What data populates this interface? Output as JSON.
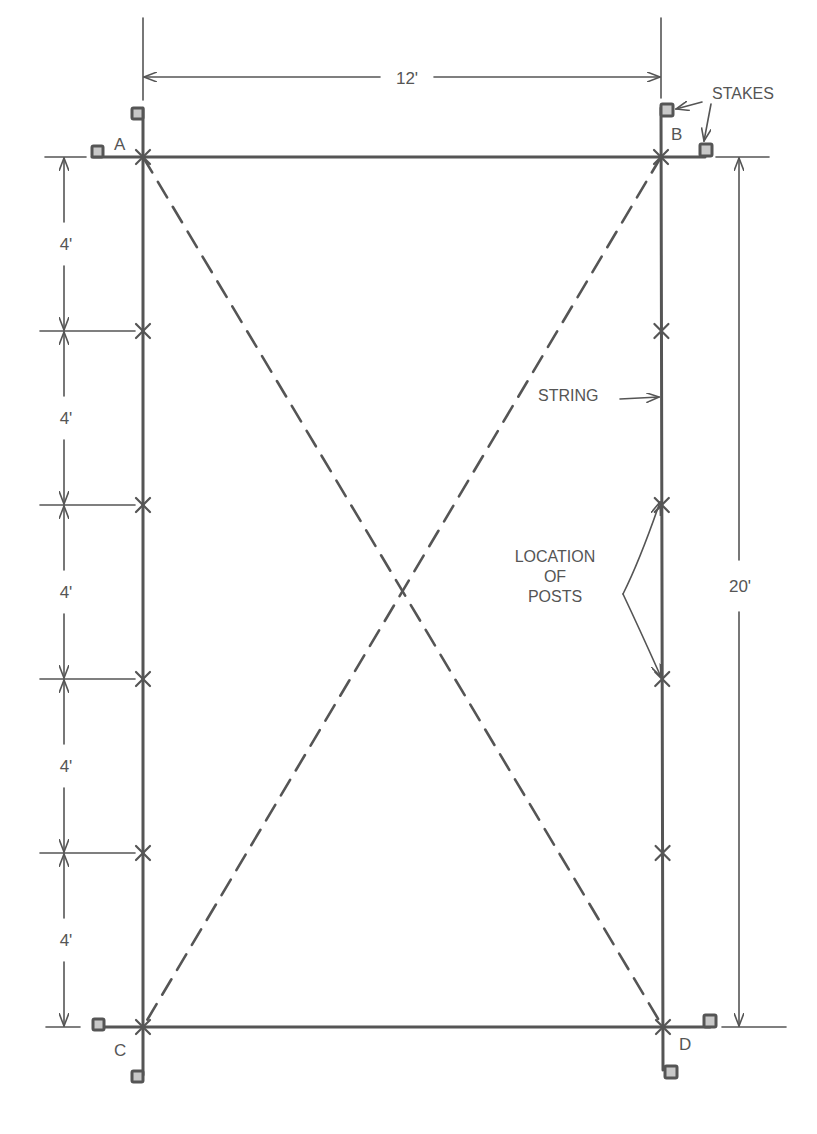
{
  "diagram": {
    "corners": {
      "a": "A",
      "b": "B",
      "c": "C",
      "d": "D"
    },
    "width_dimension": "12'",
    "length_dimension": "20'",
    "segment_dimensions": [
      "4'",
      "4'",
      "4'",
      "4'",
      "4'"
    ],
    "labels": {
      "stakes": "STAKES",
      "string": "STRING",
      "location_line1": "LOCATION",
      "location_line2": "OF",
      "location_line3": "POSTS"
    },
    "colors": {
      "ink": "#555555",
      "stake_fill": "#c8c8c8",
      "background": "#ffffff"
    }
  }
}
